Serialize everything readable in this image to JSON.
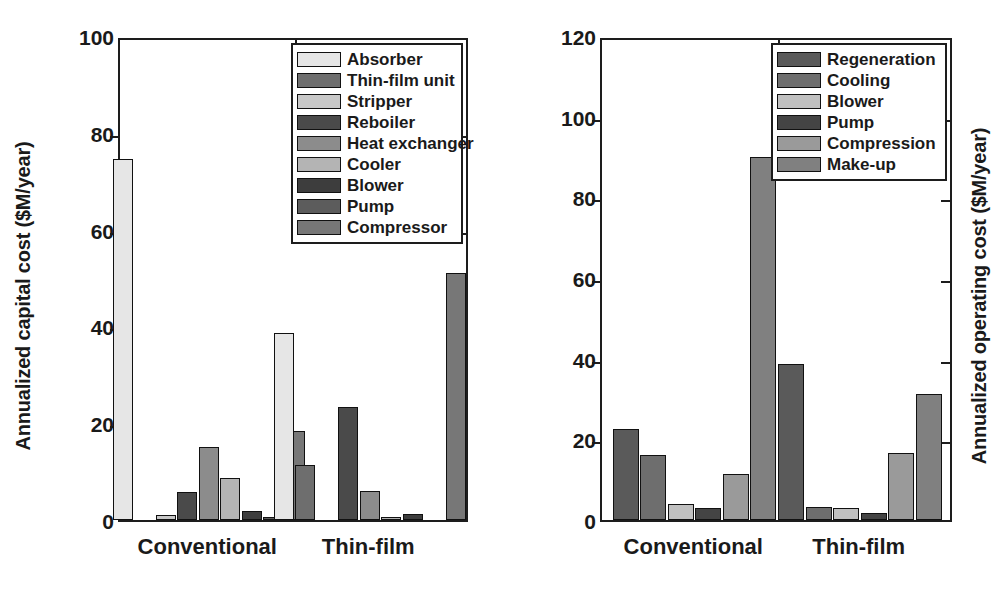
{
  "figure": {
    "panels": [
      {
        "id": "capital",
        "ylabel": "Annualized capital cost ($M/year)",
        "legend_items": [
          {
            "label": "Absorber",
            "color": "#e6e6e6"
          },
          {
            "label": "Thin-film unit",
            "color": "#6e6e6e"
          },
          {
            "label": "Stripper",
            "color": "#c8c8c8"
          },
          {
            "label": "Reboiler",
            "color": "#4a4a4a"
          },
          {
            "label": "Heat exchanger",
            "color": "#8c8c8c"
          },
          {
            "label": "Cooler",
            "color": "#b4b4b4"
          },
          {
            "label": "Blower",
            "color": "#3d3d3d"
          },
          {
            "label": "Pump",
            "color": "#5c5c5c"
          },
          {
            "label": "Compressor",
            "color": "#777777"
          }
        ]
      },
      {
        "id": "operating",
        "ylabel": "Annualized operating cost ($M/year)",
        "legend_items": [
          {
            "label": "Regeneration",
            "color": "#5a5a5a"
          },
          {
            "label": "Cooling",
            "color": "#6e6e6e"
          },
          {
            "label": "Blower",
            "color": "#c0c0c0"
          },
          {
            "label": "Pump",
            "color": "#444444"
          },
          {
            "label": "Compression",
            "color": "#9a9a9a"
          },
          {
            "label": "Make-up",
            "color": "#808080"
          }
        ]
      }
    ]
  },
  "chart_data": [
    {
      "type": "bar",
      "id": "capital",
      "title": "",
      "xlabel": "",
      "ylabel": "Annualized capital cost ($M/year)",
      "ylim": [
        0,
        100
      ],
      "yticks": [
        0,
        20,
        40,
        60,
        80,
        100
      ],
      "ytick_labels": [
        "0",
        "20",
        "40",
        "60",
        "80",
        "100"
      ],
      "grid": false,
      "legend_position": "upper right",
      "categories": [
        "Conventional",
        "Thin-film"
      ],
      "series": [
        {
          "name": "Absorber",
          "color": "#e6e6e6",
          "values": [
            74.5,
            38.6
          ]
        },
        {
          "name": "Thin-film unit",
          "color": "#6e6e6e",
          "values": [
            0,
            11.4
          ]
        },
        {
          "name": "Stripper",
          "color": "#c8c8c8",
          "values": [
            1.0,
            0
          ]
        },
        {
          "name": "Reboiler",
          "color": "#4a4a4a",
          "values": [
            5.8,
            23.3
          ]
        },
        {
          "name": "Heat exchanger",
          "color": "#8c8c8c",
          "values": [
            15.0,
            6.0
          ]
        },
        {
          "name": "Cooler",
          "color": "#b4b4b4",
          "values": [
            8.7,
            0.7
          ]
        },
        {
          "name": "Blower",
          "color": "#3d3d3d",
          "values": [
            1.8,
            1.2
          ]
        },
        {
          "name": "Pump",
          "color": "#5c5c5c",
          "values": [
            0.6,
            0
          ]
        },
        {
          "name": "Compressor",
          "color": "#777777",
          "values": [
            18.3,
            51.0
          ]
        }
      ]
    },
    {
      "type": "bar",
      "id": "operating",
      "title": "",
      "xlabel": "",
      "ylabel": "Annualized operating cost ($M/year)",
      "ylim": [
        0,
        120
      ],
      "yticks": [
        0,
        20,
        40,
        60,
        80,
        100,
        120
      ],
      "ytick_labels": [
        "0",
        "20",
        "40",
        "60",
        "80",
        "100",
        "120"
      ],
      "grid": false,
      "legend_position": "upper right",
      "categories": [
        "Conventional",
        "Thin-film"
      ],
      "series": [
        {
          "name": "Regeneration",
          "color": "#5a5a5a",
          "values": [
            22.5,
            38.6
          ]
        },
        {
          "name": "Cooling",
          "color": "#6e6e6e",
          "values": [
            16.0,
            3.2
          ]
        },
        {
          "name": "Blower",
          "color": "#c0c0c0",
          "values": [
            4.0,
            3.0
          ]
        },
        {
          "name": "Pump",
          "color": "#444444",
          "values": [
            3.0,
            1.8
          ]
        },
        {
          "name": "Compression",
          "color": "#9a9a9a",
          "values": [
            11.5,
            16.7
          ]
        },
        {
          "name": "Make-up",
          "color": "#808080",
          "values": [
            90.0,
            31.3
          ]
        }
      ]
    }
  ]
}
